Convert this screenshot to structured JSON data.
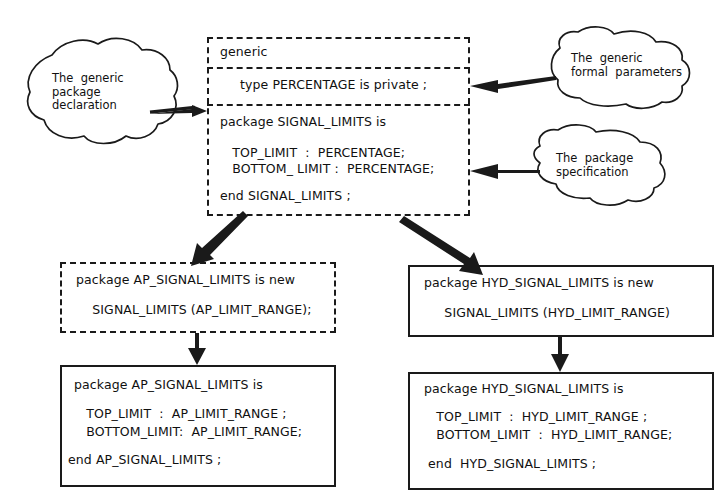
{
  "diagram": {
    "stroke_color": "#1a1a1a",
    "text_color": "#101010",
    "background": "#ffffff"
  },
  "generic_package": {
    "header_line": "generic",
    "formal_parameter_line": "type PERCENTAGE is private ;",
    "spec_lines": [
      "package SIGNAL_LIMITS is",
      "   TOP_LIMIT  :  PERCENTAGE;",
      "   BOTTOM_ LIMIT :  PERCENTAGE;",
      "end SIGNAL_LIMITS ;"
    ]
  },
  "callouts": {
    "generic_package_declaration": {
      "lines": [
        "The  generic",
        "package",
        "declaration"
      ]
    },
    "generic_formal_parameters": {
      "lines": [
        "The  generic",
        "formal  parameters"
      ]
    },
    "package_specification": {
      "lines": [
        "The  package",
        "specification"
      ]
    }
  },
  "instantiations": {
    "ap": {
      "lines": [
        "package AP_SIGNAL_LIMITS is new",
        "    SIGNAL_LIMITS (AP_LIMIT_RANGE);"
      ]
    },
    "hyd": {
      "lines": [
        "package HYD_SIGNAL_LIMITS is new",
        "     SIGNAL_LIMITS (HYD_LIMIT_RANGE)"
      ]
    }
  },
  "resulting_packages": {
    "ap": {
      "lines": [
        "package AP_SIGNAL_LIMITS is",
        "   TOP_LIMIT  :  AP_LIMIT_RANGE ;",
        "   BOTTOM_LIMIT:  AP_LIMIT_RANGE;",
        "end AP_SIGNAL_LIMITS ;"
      ]
    },
    "hyd": {
      "lines": [
        "package HYD_SIGNAL_LIMITS is",
        "   TOP_LIMIT  :  HYD_LIMIT_RANGE ;",
        "   BOTTOM_LIMIT  :  HYD_LIMIT_RANGE;",
        " end  HYD_SIGNAL_LIMITS ;"
      ]
    }
  }
}
